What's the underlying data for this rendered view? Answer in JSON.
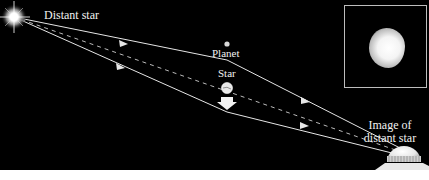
{
  "diagram": {
    "labels": {
      "distant_star": "Distant star",
      "planet": "Planet",
      "star": "Star",
      "image_line1": "Image of",
      "image_line2": "distant star"
    },
    "elements": [
      {
        "id": "distant-star",
        "type": "light-source",
        "position": [
          14,
          17
        ]
      },
      {
        "id": "planet",
        "type": "small-body",
        "position": [
          227,
          44
        ]
      },
      {
        "id": "lens-star",
        "type": "star",
        "position": [
          227,
          88
        ],
        "motion": "down-arrow"
      },
      {
        "id": "observer",
        "type": "telescope-dome",
        "position": [
          404,
          158
        ]
      },
      {
        "id": "inset-image",
        "type": "image-panel",
        "content": "blurred image of distant star"
      }
    ],
    "rays": [
      {
        "style": "solid",
        "path": [
          [
            14,
            17
          ],
          [
            227,
            60
          ],
          [
            404,
            150
          ]
        ],
        "arrows": [
          [
            124,
            43
          ],
          [
            307,
            100
          ]
        ]
      },
      {
        "style": "solid",
        "path": [
          [
            14,
            17
          ],
          [
            227,
            112
          ],
          [
            404,
            156
          ]
        ],
        "arrows": [
          [
            121,
            67
          ],
          [
            305,
            125
          ]
        ]
      },
      {
        "style": "dashed",
        "path": [
          [
            14,
            17
          ],
          [
            404,
            153
          ]
        ]
      }
    ],
    "caption": ""
  },
  "colors": {
    "background": "#000000",
    "ray": "#e6e6e6",
    "text": "#f2f2f2",
    "inset_border": "#bdbdbd"
  }
}
